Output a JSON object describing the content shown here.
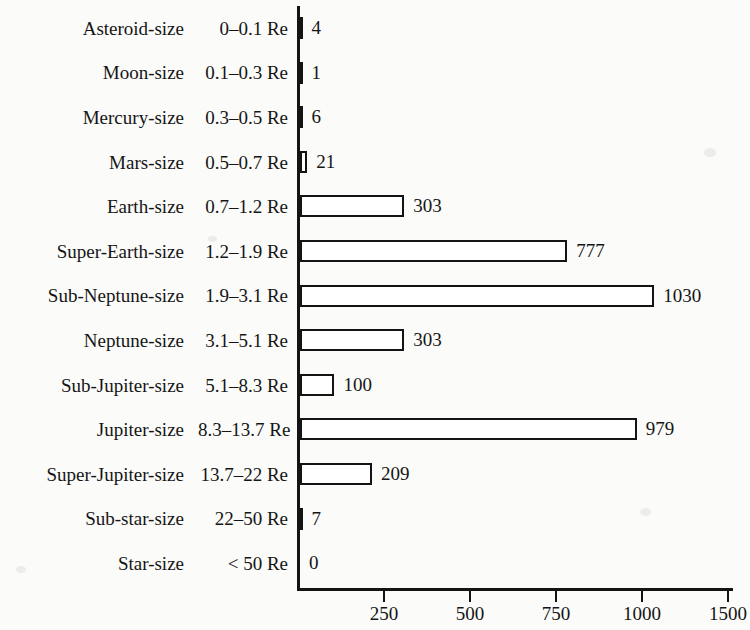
{
  "chart_data": {
    "type": "bar",
    "orientation": "horizontal",
    "title": "",
    "subtitle": "",
    "xlabel": "",
    "ylabel": "",
    "grid": false,
    "legend": false,
    "xlim": [
      0,
      1250
    ],
    "xticks": [
      250,
      500,
      750,
      1000,
      1500
    ],
    "xtick_labels": [
      "250",
      "500",
      "750",
      "1000",
      "1500"
    ],
    "categories": [
      "Asteroid-size",
      "Moon-size",
      "Mercury-size",
      "Mars-size",
      "Earth-size",
      "Super-Earth-size",
      "Sub-Neptune-size",
      "Neptune-size",
      "Sub-Jupiter-size",
      "Jupiter-size",
      "Super-Jupiter-size",
      "Sub-star-size",
      "Star-size"
    ],
    "category_ranges": [
      "0–0.1 Re",
      "0.1–0.3 Re",
      "0.3–0.5 Re",
      "0.5–0.7 Re",
      "0.7–1.2 Re",
      "1.2–1.9 Re",
      "1.9–3.1 Re",
      "3.1–5.1 Re",
      "5.1–8.3 Re",
      "8.3–13.7 Re",
      "13.7–22 Re",
      "22–50 Re",
      "< 50 Re"
    ],
    "values": [
      4,
      1,
      6,
      21,
      303,
      777,
      1030,
      303,
      100,
      979,
      209,
      7,
      0
    ],
    "value_labels": [
      "4",
      "1",
      "6",
      "21",
      "303",
      "777",
      "1030",
      "303",
      "100",
      "979",
      "209",
      "7",
      "0"
    ],
    "colors": {
      "bar_fill": "#ffffff",
      "bar_stroke": "#141414",
      "axis": "#141414",
      "text": "#151515",
      "background": "#fbfbfa"
    }
  },
  "rows": [
    {
      "name": "Asteroid-size",
      "range": "0–0.1 Re",
      "value": 4,
      "label": "4"
    },
    {
      "name": "Moon-size",
      "range": "0.1–0.3 Re",
      "value": 1,
      "label": "1"
    },
    {
      "name": "Mercury-size",
      "range": "0.3–0.5 Re",
      "value": 6,
      "label": "6"
    },
    {
      "name": "Mars-size",
      "range": "0.5–0.7 Re",
      "value": 21,
      "label": "21"
    },
    {
      "name": "Earth-size",
      "range": "0.7–1.2 Re",
      "value": 303,
      "label": "303"
    },
    {
      "name": "Super-Earth-size",
      "range": "1.2–1.9 Re",
      "value": 777,
      "label": "777"
    },
    {
      "name": "Sub-Neptune-size",
      "range": "1.9–3.1 Re",
      "value": 1030,
      "label": "1030"
    },
    {
      "name": "Neptune-size",
      "range": "3.1–5.1 Re",
      "value": 303,
      "label": "303"
    },
    {
      "name": "Sub-Jupiter-size",
      "range": "5.1–8.3 Re",
      "value": 100,
      "label": "100"
    },
    {
      "name": "Jupiter-size",
      "range": "8.3–13.7 Re",
      "value": 979,
      "label": "979"
    },
    {
      "name": "Super-Jupiter-size",
      "range": "13.7–22 Re",
      "value": 209,
      "label": "209"
    },
    {
      "name": "Sub-star-size",
      "range": "22–50 Re",
      "value": 7,
      "label": "7"
    },
    {
      "name": "Star-size",
      "range": "< 50 Re",
      "value": 0,
      "label": "0"
    }
  ],
  "axis": {
    "ticks": [
      "250",
      "500",
      "750",
      "1000",
      "1500"
    ]
  }
}
